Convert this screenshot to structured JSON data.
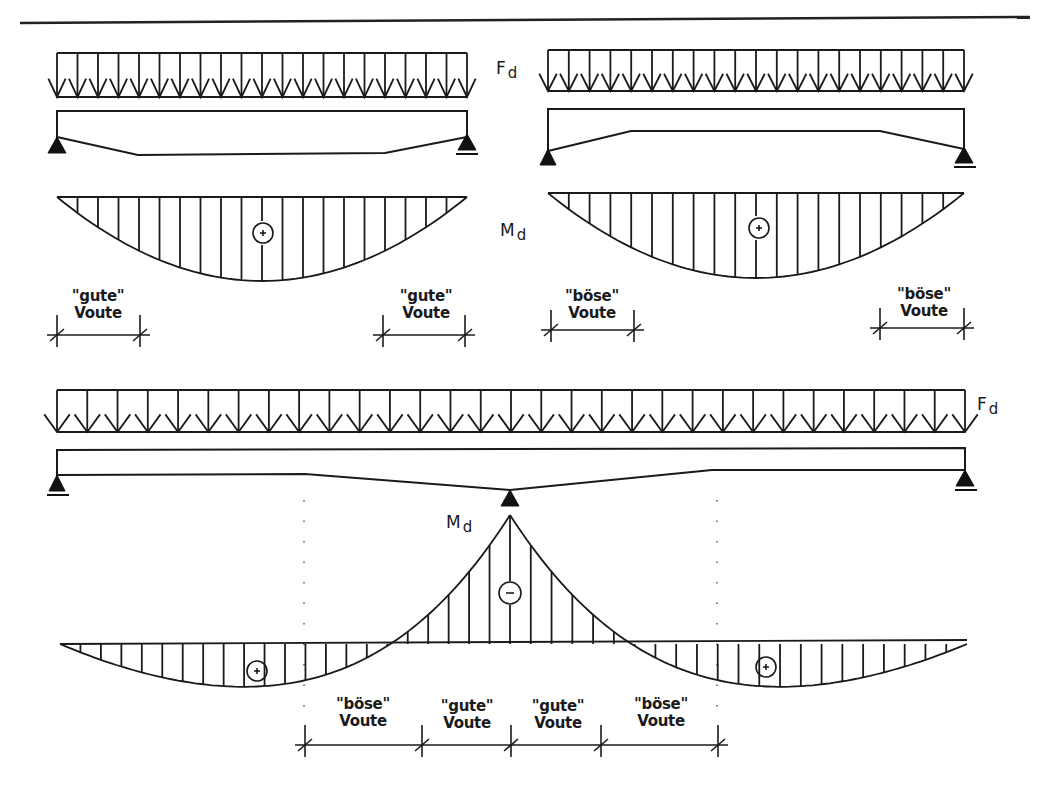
{
  "figure": {
    "load_symbol": {
      "main": "F",
      "sub": "d"
    },
    "moment_symbol": {
      "main": "M",
      "sub": "d"
    },
    "sign_positive": "+",
    "sign_negative": "−"
  },
  "panels": {
    "top_left": {
      "title": "simply supported beam, haunches on underside near supports",
      "haunch_labels": [
        {
          "line1": "\"gute\"",
          "line2": "Voute"
        },
        {
          "line1": "\"gute\"",
          "line2": "Voute"
        }
      ]
    },
    "top_right": {
      "title": "simply supported beam, haunches thickened toward midspan",
      "haunch_labels": [
        {
          "line1": "\"böse\"",
          "line2": "Voute"
        },
        {
          "line1": "\"böse\"",
          "line2": "Voute"
        }
      ]
    },
    "bottom": {
      "title": "two-span continuous beam, haunch over middle support",
      "haunch_labels": [
        {
          "line1": "\"böse\"",
          "line2": "Voute"
        },
        {
          "line1": "\"gute\"",
          "line2": "Voute"
        },
        {
          "line1": "\"gute\"",
          "line2": "Voute"
        },
        {
          "line1": "\"böse\"",
          "line2": "Voute"
        }
      ]
    }
  }
}
